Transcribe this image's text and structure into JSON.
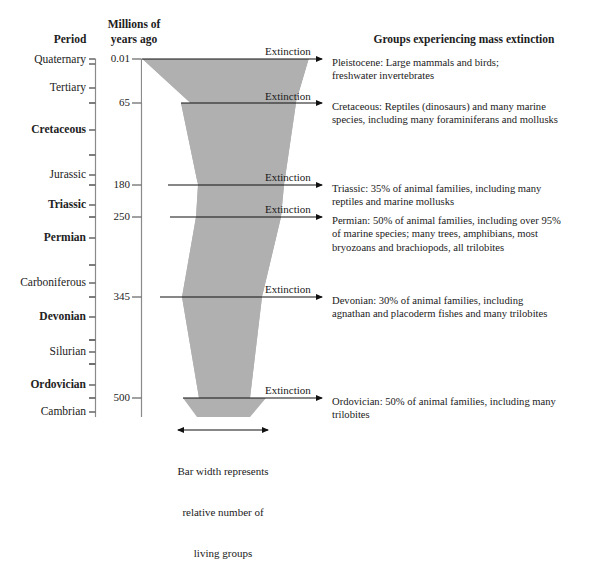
{
  "headers": {
    "period": "Period",
    "millions_line1": "Millions of",
    "millions_line2": "years ago",
    "groups": "Groups experiencing mass extinction"
  },
  "periods": [
    {
      "name": "Quaternary",
      "bold": false,
      "y": 60
    },
    {
      "name": "Tertiary",
      "bold": false,
      "y": 88
    },
    {
      "name": "Cretaceous",
      "bold": true,
      "y": 130
    },
    {
      "name": "Jurassic",
      "bold": false,
      "y": 175
    },
    {
      "name": "Triassic",
      "bold": true,
      "y": 205
    },
    {
      "name": "Permian",
      "bold": true,
      "y": 238
    },
    {
      "name": "Carboniferous",
      "bold": false,
      "y": 283
    },
    {
      "name": "Devonian",
      "bold": true,
      "y": 317
    },
    {
      "name": "Silurian",
      "bold": false,
      "y": 352
    },
    {
      "name": "Ordovician",
      "bold": true,
      "y": 385
    },
    {
      "name": "Cambrian",
      "bold": false,
      "y": 412
    }
  ],
  "year_marks": [
    {
      "value": "0.01",
      "y": 59
    },
    {
      "value": "65",
      "y": 103
    },
    {
      "value": "180",
      "y": 185
    },
    {
      "value": "250",
      "y": 217
    },
    {
      "value": "345",
      "y": 297
    },
    {
      "value": "500",
      "y": 398
    }
  ],
  "extinction_label": "Extinction",
  "extinction_events": [
    {
      "label": "Extinction",
      "label_y": 45,
      "arrow_y": 59
    },
    {
      "label": "Extinction",
      "label_y": 90,
      "arrow_y": 103
    },
    {
      "label": "Extinction",
      "label_y": 171,
      "arrow_y": 185
    },
    {
      "label": "Extinction",
      "label_y": 203,
      "arrow_y": 217
    },
    {
      "label": "Extinction",
      "label_y": 283,
      "arrow_y": 297
    },
    {
      "label": "Extinction",
      "label_y": 384,
      "arrow_y": 398
    }
  ],
  "descriptions": [
    {
      "y": 56,
      "lines": [
        "Pleistocene: Large mammals and birds;",
        "freshwater invertebrates"
      ]
    },
    {
      "y": 100,
      "lines": [
        "Cretaceous: Reptiles (dinosaurs) and many marine",
        "species, including many foraminiferans and mollusks"
      ]
    },
    {
      "y": 182,
      "lines": [
        "Triassic: 35% of animal families, including many",
        "reptiles and marine mollusks"
      ]
    },
    {
      "y": 214,
      "lines": [
        "Permian: 50% of animal families, including over 95%",
        "of marine species; many trees, amphibians, most",
        "bryozoans and brachiopods, all trilobites"
      ]
    },
    {
      "y": 294,
      "lines": [
        "Devonian: 30% of animal families, including",
        "agnathan and placoderm fishes and many trilobites"
      ]
    },
    {
      "y": 395,
      "lines": [
        "Ordovician: 50% of animal families, including many",
        "trilobites"
      ]
    }
  ],
  "caption": {
    "line1": "Bar width represents",
    "line2": "relative number of",
    "line3": "living groups"
  },
  "colors": {
    "bar_fill": "#b0b0b0",
    "line": "#6f6f6f",
    "text": "#1a1a1a",
    "arrow": "#111111"
  },
  "bar_geometry": {
    "description": "inverted funnel, notched at each mass extinction",
    "top_y": 59,
    "bottom_y": 417,
    "top_left_x": 142,
    "top_right_x": 309,
    "bottom_left_x": 197,
    "bottom_right_x": 246
  }
}
